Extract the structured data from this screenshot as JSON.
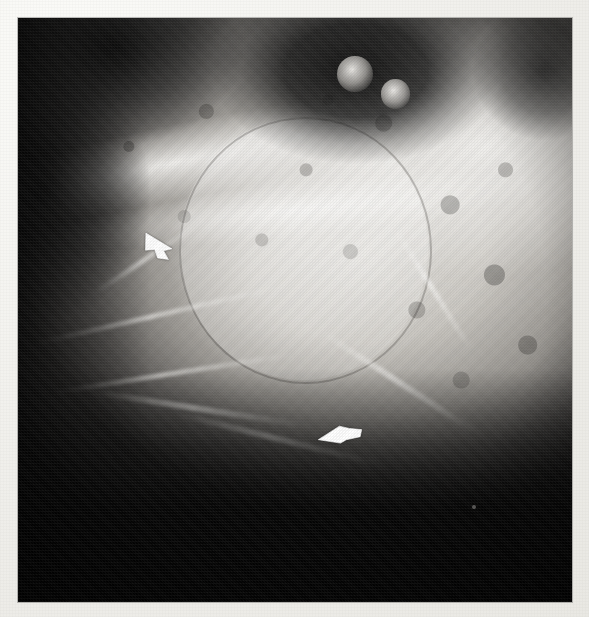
{
  "figure": {
    "kind": "radiograph",
    "modality": "plain-film radiograph",
    "orientation": "lateral oblique",
    "caption": "",
    "title": "",
    "background_color": "#f2f1ed",
    "plate_color": "#050505",
    "plate": {
      "x": 18,
      "y": 18,
      "width": 554,
      "height": 584
    }
  },
  "annotations": {
    "arrows": [
      {
        "id": "arrow-upper",
        "label": "arrow-1",
        "color": "#ffffff",
        "direction": "right-down",
        "rotation_deg": 14,
        "x": 142,
        "y": 232,
        "width": 46,
        "height": 30,
        "marks": "anterior-inferior cortical margin of lesion"
      },
      {
        "id": "arrow-lower",
        "label": "arrow-2",
        "color": "#ffffff",
        "direction": "left",
        "rotation_deg": -8,
        "x": 316,
        "y": 420,
        "width": 50,
        "height": 30,
        "marks": "inferior border / expanded cortex"
      }
    ],
    "specks": [
      {
        "id": "speck-1",
        "x": 472,
        "y": 505,
        "size": 4
      }
    ]
  },
  "radiodense_spots": [
    {
      "id": "spot-a",
      "description": "small round radiopacity",
      "left_pct": 57.5,
      "top_pct": 6.5
    },
    {
      "id": "spot-b",
      "description": "small round radiopacity",
      "left_pct": 65.5,
      "top_pct": 10.5
    }
  ],
  "regions": [
    {
      "id": "lesion",
      "description": "large rounded mottled lesion",
      "left_pct": 29,
      "top_pct": 17,
      "width_pct": 45,
      "height_pct": 45
    },
    {
      "id": "mass-upper-right",
      "description": "dense bone mass upper right"
    },
    {
      "id": "dark-pocket-upper-right",
      "description": "radiolucent air space upper middle"
    },
    {
      "id": "dark-pocket-upper-left",
      "description": "radiolucent region upper left"
    },
    {
      "id": "dark-lower",
      "description": "deep black soft-tissue / air region lower half"
    }
  ],
  "palette": {
    "paper": "#f2f1ed",
    "film_black": "#050505",
    "bone_bright": "#e4e2dd",
    "bone_mid": "#8e8b86",
    "arrow_white": "#ffffff"
  }
}
